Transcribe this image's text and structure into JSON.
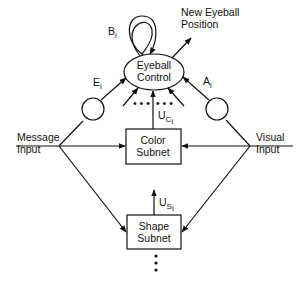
{
  "diagram": {
    "nodes": {
      "eyeball_control": {
        "line1": "Eyeball",
        "line2": "Control"
      },
      "color_subnet": {
        "line1": "Color",
        "line2": "Subnet"
      },
      "shape_subnet": {
        "line1": "Shape",
        "line2": "Subnet"
      }
    },
    "inputs": {
      "message": {
        "line1": "Message",
        "line2": "Input"
      },
      "visual": {
        "line1": "Visual",
        "line2": "Input"
      }
    },
    "output": {
      "line1": "New Eyeball",
      "line2": "Position"
    },
    "weights": {
      "B": {
        "main": "B",
        "sub": "i"
      },
      "E": {
        "main": "E",
        "sub": "i"
      },
      "A": {
        "main": "A",
        "sub": "i"
      },
      "UC": {
        "main": "U",
        "sub1": "C",
        "sub2": "i"
      },
      "US": {
        "main": "U",
        "sub1": "S",
        "sub2": "i"
      }
    },
    "ellipsis": "• • •"
  }
}
